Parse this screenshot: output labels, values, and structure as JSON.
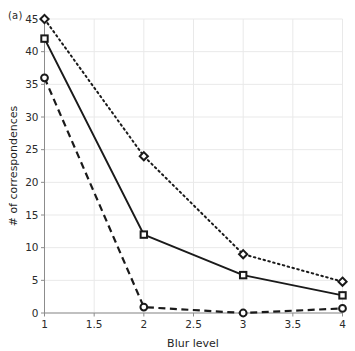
{
  "figure": {
    "panel_label": "(a)",
    "background_color": "#ffffff",
    "grid_color": "#e9e9e9",
    "axis_color": "#8c8c8c",
    "line_color": "#1a1a1a"
  },
  "chart_data": {
    "type": "line",
    "title": "",
    "xlabel": "Blur level",
    "ylabel": "# of correspondences",
    "x": [
      1,
      2,
      3,
      4
    ],
    "xlim": [
      1,
      4
    ],
    "ylim": [
      0,
      45
    ],
    "xticks": [
      "1",
      "1.5",
      "2",
      "2.5",
      "3",
      "3.5",
      "4"
    ],
    "xtick_values": [
      1,
      1.5,
      2,
      2.5,
      3,
      3.5,
      4
    ],
    "yticks": [
      "0",
      "5",
      "10",
      "15",
      "20",
      "25",
      "30",
      "35",
      "40",
      "45"
    ],
    "ytick_values": [
      0,
      5,
      10,
      15,
      20,
      25,
      30,
      35,
      40,
      45
    ],
    "grid": true,
    "legend": "none",
    "series": [
      {
        "name": "dotted-diamond",
        "linestyle": "dotted",
        "marker": "diamond",
        "color": "#1a1a1a",
        "values": [
          45,
          24,
          9,
          4.8
        ]
      },
      {
        "name": "solid-square",
        "linestyle": "solid",
        "marker": "square",
        "color": "#1a1a1a",
        "values": [
          42,
          12,
          5.8,
          2.7
        ]
      },
      {
        "name": "dashed-circle",
        "linestyle": "dashed",
        "marker": "circle",
        "color": "#1a1a1a",
        "values": [
          36,
          0.9,
          0,
          0.7
        ]
      }
    ]
  }
}
